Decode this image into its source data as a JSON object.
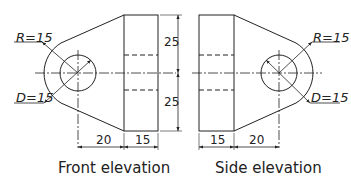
{
  "front": {
    "caption": "Front elevation",
    "radius_label": "R=15",
    "diameter_label": "D=15",
    "dim_top": "25",
    "dim_bottom": "25",
    "dim_left": "20",
    "dim_right": "15"
  },
  "side": {
    "caption": "Side elevation",
    "radius_label": "R=15",
    "diameter_label": "D=15",
    "dim_left": "15",
    "dim_right": "20"
  },
  "colors": {
    "line": "#222222",
    "background": "#ffffff"
  }
}
